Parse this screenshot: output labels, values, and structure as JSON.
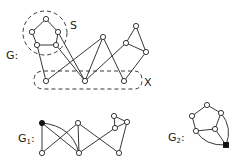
{
  "labels": {
    "g": "G:",
    "s": "S",
    "x": "X",
    "g1_main": "G",
    "g1_sub": "1",
    "g1_colon": ":",
    "g2_main": "G",
    "g2_sub": "2",
    "g2_colon": ":"
  },
  "graphs": {
    "G": {
      "nodes": [
        {
          "id": "p_top",
          "x": 46,
          "y": 19
        },
        {
          "id": "p_ul",
          "x": 32,
          "y": 32
        },
        {
          "id": "p_ur",
          "x": 58,
          "y": 32
        },
        {
          "id": "p_ll",
          "x": 37,
          "y": 45
        },
        {
          "id": "p_lr",
          "x": 56,
          "y": 45
        },
        {
          "id": "c_top",
          "x": 103,
          "y": 37
        },
        {
          "id": "r_top",
          "x": 136,
          "y": 26
        },
        {
          "id": "r_left",
          "x": 126,
          "y": 43
        },
        {
          "id": "r_right",
          "x": 146,
          "y": 52
        },
        {
          "id": "x_left",
          "x": 46,
          "y": 81
        },
        {
          "id": "x_mid",
          "x": 85,
          "y": 81
        },
        {
          "id": "x_right",
          "x": 124,
          "y": 81
        }
      ],
      "subsets": [
        "S",
        "X"
      ]
    },
    "G1": {
      "nodes": [
        {
          "id": "black",
          "x": 42,
          "y": 123,
          "filled": true
        },
        {
          "id": "bl",
          "x": 42,
          "y": 153
        },
        {
          "id": "tm",
          "x": 78,
          "y": 123
        },
        {
          "id": "bm",
          "x": 79,
          "y": 153
        },
        {
          "id": "rt",
          "x": 114,
          "y": 116
        },
        {
          "id": "rr",
          "x": 127,
          "y": 122
        },
        {
          "id": "rl",
          "x": 115,
          "y": 128
        },
        {
          "id": "br",
          "x": 119,
          "y": 153
        }
      ]
    },
    "G2": {
      "nodes": [
        {
          "id": "top",
          "x": 207,
          "y": 105
        },
        {
          "id": "ul",
          "x": 192,
          "y": 116
        },
        {
          "id": "ur",
          "x": 221,
          "y": 113
        },
        {
          "id": "ll",
          "x": 196,
          "y": 131
        },
        {
          "id": "lr",
          "x": 215,
          "y": 129
        },
        {
          "id": "black",
          "x": 226,
          "y": 145,
          "filled": true
        }
      ]
    }
  }
}
